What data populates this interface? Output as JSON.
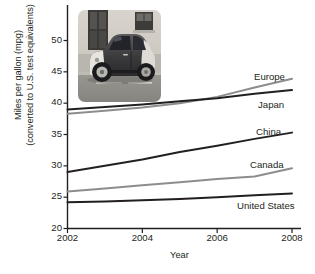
{
  "chart_data": {
    "type": "line",
    "title": "",
    "xlabel": "Year",
    "ylabel": "Miles per gallon (mpg) (converted to U.S. test equivalents)",
    "ylabel_line1": "Miles per gallon (mpg)",
    "ylabel_line2": "(converted to U.S. test equivalents)",
    "x": [
      2002,
      2003,
      2004,
      2005,
      2006,
      2007,
      2008
    ],
    "xticks": [
      "2002",
      "2004",
      "2006",
      "2008"
    ],
    "xtick_values": [
      2002,
      2004,
      2006,
      2008
    ],
    "yticks": [
      "20",
      "25",
      "30",
      "35",
      "40",
      "45",
      "50"
    ],
    "ytick_values": [
      20,
      25,
      30,
      35,
      40,
      45,
      50
    ],
    "xlim": [
      2002,
      2008
    ],
    "ylim": [
      20,
      50
    ],
    "grid": false,
    "legend_position": "right-inline",
    "series": [
      {
        "name": "Europe",
        "color": "#8d8d8d",
        "values": [
          38.3,
          38.8,
          39.3,
          40.0,
          41.0,
          42.5,
          43.9
        ]
      },
      {
        "name": "Japan",
        "color": "#231f20",
        "values": [
          39.0,
          39.4,
          39.8,
          40.3,
          40.8,
          41.5,
          42.1
        ]
      },
      {
        "name": "China",
        "color": "#231f20",
        "values": [
          29.0,
          30.0,
          31.0,
          32.2,
          33.2,
          34.3,
          35.3
        ]
      },
      {
        "name": "Canada",
        "color": "#8d8d8d",
        "values": [
          25.9,
          26.4,
          26.9,
          27.4,
          27.9,
          28.3,
          29.6
        ]
      },
      {
        "name": "United States",
        "color": "#231f20",
        "values": [
          24.2,
          24.3,
          24.5,
          24.7,
          25.0,
          25.3,
          25.6
        ]
      }
    ],
    "annotations": [
      {
        "name": "inset-photo",
        "description": "photograph of a small two-seat city car parked on a street"
      }
    ]
  },
  "axis_colors": {
    "axis_line": "#231f20",
    "text": "#231f20",
    "background": "#ffffff"
  }
}
